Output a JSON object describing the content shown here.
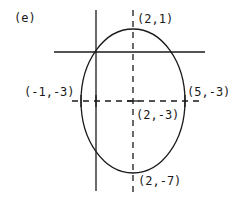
{
  "figure": {
    "panel_label": "(e)",
    "type": "ellipse-graph",
    "ellipse": {
      "center": "(2,-3)",
      "top_vertex": "(2,1)",
      "bottom_vertex": "(2,-7)",
      "left_point": "(-1,-3)",
      "right_point": "(5,-3)"
    },
    "labels": {
      "top": "(2,1)",
      "left": "(-1,-3)",
      "right": "(5,-3)",
      "center": "(2,-3)",
      "bottom": "(2,-7)"
    },
    "colors": {
      "stroke": "#1a1a1a",
      "background": "#ffffff"
    }
  }
}
